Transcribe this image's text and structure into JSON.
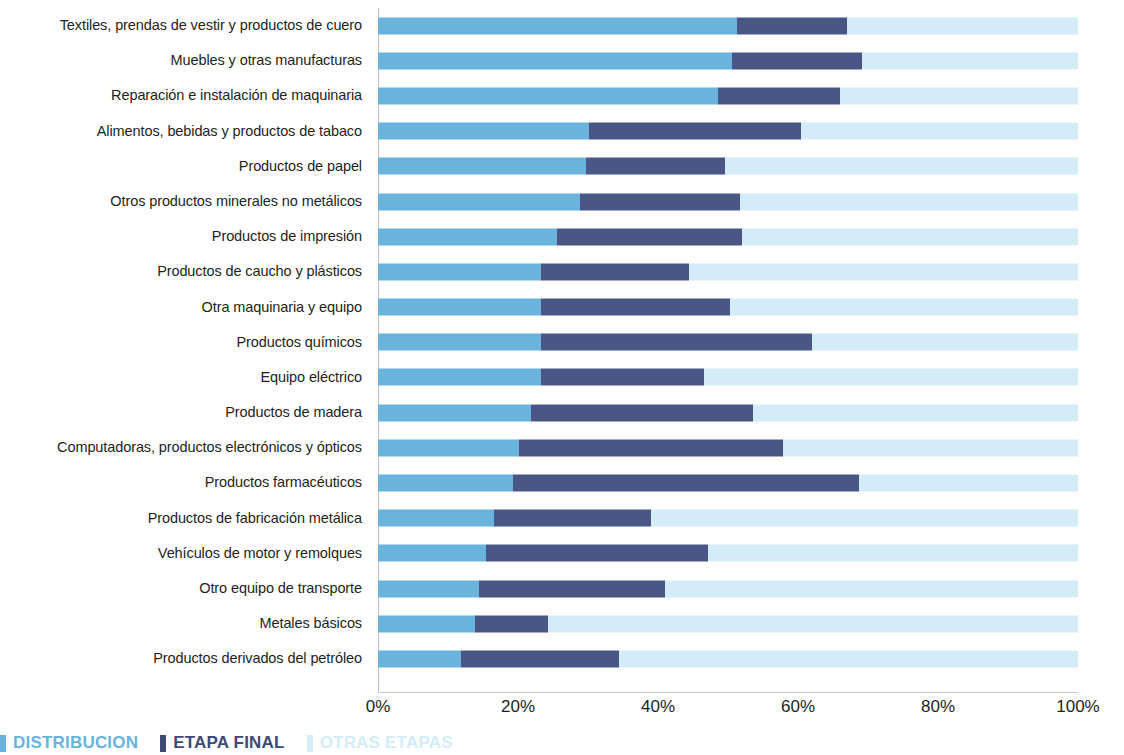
{
  "legend": {
    "items": [
      {
        "label": "DISTRIBUCION",
        "color": "#69b3dd"
      },
      {
        "label": "ETAPA FINAL",
        "color": "#3d4a76"
      },
      {
        "label": "OTRAS ETAPAS",
        "color": "#d3ecf7"
      }
    ]
  },
  "axis": {
    "ticks": [
      "0%",
      "20%",
      "40%",
      "60%",
      "80%",
      "100%"
    ],
    "tick_values": [
      0,
      20,
      40,
      60,
      80,
      100
    ]
  },
  "chart_data": {
    "type": "bar",
    "orientation": "horizontal",
    "stacked": true,
    "normalized_percent": true,
    "title": "",
    "subtitle": "",
    "xlabel": "",
    "ylabel": "",
    "xlim": [
      0,
      100
    ],
    "grid": false,
    "legend_position": "bottom-left",
    "tick_labels": [
      "0%",
      "20%",
      "40%",
      "60%",
      "80%",
      "100%"
    ],
    "categories": [
      "Textiles, prendas de vestir y productos de cuero",
      "Muebles y otras manufacturas",
      "Reparación e instalación de maquinaria",
      "Alimentos, bebidas y productos de tabaco",
      "Productos de papel",
      "Otros productos minerales no metálicos",
      "Productos de impresión",
      "Productos de caucho y plásticos",
      "Otra maquinaria y equipo",
      "Productos químicos",
      "Equipo eléctrico",
      "Productos de madera",
      "Computadoras, productos electrónicos y ópticos",
      "Productos farmacéuticos",
      "Productos de fabricación metálica",
      "Vehículos de motor y remolques",
      "Otro equipo de transporte",
      "Metales básicos",
      "Productos derivados del petróleo"
    ],
    "series": [
      {
        "name": "DISTRIBUCION",
        "color": "#69b3dd",
        "values": [
          51.3,
          50.6,
          48.6,
          30.1,
          29.7,
          28.9,
          25.6,
          23.3,
          23.3,
          23.3,
          23.3,
          21.9,
          20.1,
          19.3,
          16.6,
          15.4,
          14.4,
          13.9,
          11.9
        ]
      },
      {
        "name": "ETAPA FINAL",
        "color": "#4a5685",
        "values": [
          15.7,
          18.5,
          17.4,
          30.4,
          19.9,
          22.8,
          26.4,
          21.1,
          27.0,
          38.7,
          23.3,
          31.7,
          37.7,
          49.4,
          22.4,
          31.7,
          26.6,
          10.4,
          22.5
        ]
      },
      {
        "name": "OTRAS ETAPAS",
        "color": "#d3ecf7",
        "values": [
          33.0,
          30.9,
          34.0,
          39.5,
          50.4,
          48.3,
          48.0,
          55.6,
          49.7,
          38.0,
          53.4,
          46.4,
          42.2,
          31.3,
          61.0,
          52.9,
          59.0,
          75.7,
          65.6
        ]
      }
    ],
    "cumulative_end_etapa_final": [
      67.0,
      69.1,
      66.0,
      60.5,
      49.6,
      51.7,
      52.0,
      44.4,
      50.3,
      62.0,
      46.6,
      53.6,
      57.8,
      68.7,
      39.0,
      47.1,
      41.0,
      24.3,
      34.4
    ]
  }
}
